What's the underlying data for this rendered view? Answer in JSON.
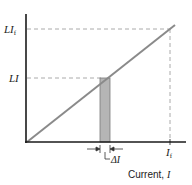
{
  "diagram": {
    "type": "inductor-energy-graph",
    "y_labels": {
      "top": {
        "main": "LI",
        "sub": "f"
      },
      "mid": {
        "main": "LI",
        "sub": ""
      }
    },
    "x_labels": {
      "final_current": {
        "main": "I",
        "sub": "f"
      },
      "delta": "ΔI",
      "axis_title_prefix": "Current, ",
      "axis_title_var": "I"
    },
    "colors": {
      "axis": "#1a1a1a",
      "line": "#8a8a8a",
      "dashed": "#aaaaaa",
      "bar_fill": "#b5b5b5",
      "bar_stroke": "#7a7a7a"
    }
  }
}
